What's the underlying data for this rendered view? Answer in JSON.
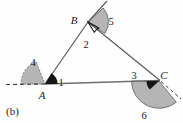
{
  "figure": {
    "caption": "(b)",
    "vertex_labels": [
      {
        "name": "A",
        "text": "A",
        "x": 42,
        "y": 97
      },
      {
        "name": "B",
        "text": "B",
        "x": 74,
        "y": 21
      },
      {
        "name": "C",
        "text": "C",
        "x": 161,
        "y": 79
      }
    ],
    "angle_labels": [
      {
        "name": "angle-1",
        "text": "1",
        "x": 59,
        "y": 82,
        "kind": "interior"
      },
      {
        "name": "angle-2",
        "text": "2",
        "x": 85,
        "y": 46,
        "kind": "interior"
      },
      {
        "name": "angle-3",
        "text": "3",
        "x": 133,
        "y": 78,
        "kind": "interior"
      },
      {
        "name": "angle-4",
        "text": "4",
        "x": 32,
        "y": 64,
        "kind": "exterior"
      },
      {
        "name": "angle-5",
        "text": "5",
        "x": 110,
        "y": 23,
        "kind": "exterior"
      },
      {
        "name": "angle-6",
        "text": "6",
        "x": 143,
        "y": 117,
        "kind": "exterior"
      }
    ],
    "colors": {
      "shade_fill": "#b5b5b5",
      "shade_stroke": "#5a5a5a",
      "line": "#4a4a4a",
      "line_dark": "#1c1c1c",
      "text": "#1c1c1c",
      "background": "#fefefe"
    },
    "points": {
      "A": {
        "x": 45,
        "y": 84
      },
      "B": {
        "x": 88,
        "y": 22
      },
      "C": {
        "x": 160,
        "y": 80
      }
    },
    "extensions": {
      "A_left_dashed_end": {
        "x": 4,
        "y": 84
      },
      "B_up_solid_end": {
        "x": 106,
        "y": 3
      },
      "C_down_dashed_end": {
        "x": 180,
        "y": 99
      }
    }
  }
}
